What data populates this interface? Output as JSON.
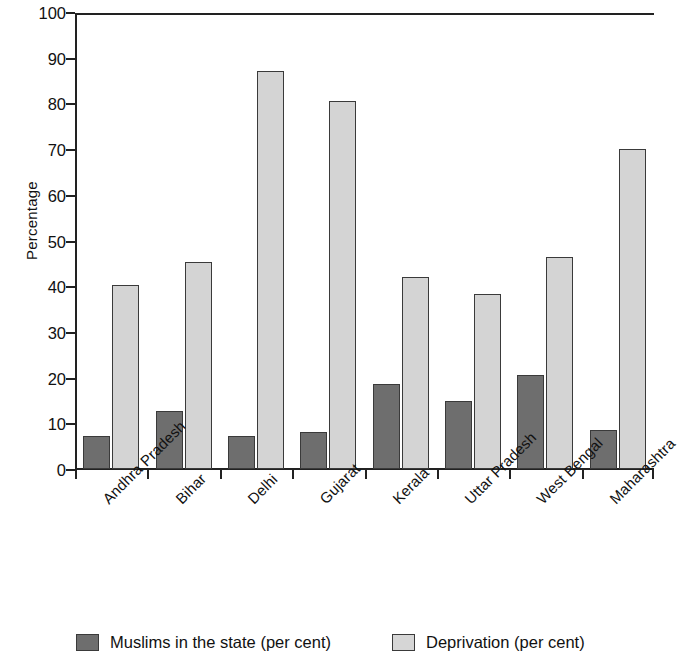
{
  "chart_data": {
    "type": "bar",
    "title": "",
    "xlabel": "",
    "ylabel": "Percentage",
    "ylim": [
      0,
      100
    ],
    "yticks": [
      0,
      10,
      20,
      30,
      40,
      50,
      60,
      70,
      80,
      90,
      100
    ],
    "grid": false,
    "legend_position": "bottom",
    "categories": [
      "Andhra Pradesh",
      "Bihar",
      "Delhi",
      "Gujarat",
      "Kerala",
      "Uttar Pradesh",
      "West Bengal",
      "Maharashtra"
    ],
    "series": [
      {
        "name": "Muslims in the state (per cent)",
        "color": "#6e6e6e",
        "values": [
          7.2,
          12.6,
          7.2,
          8.2,
          18.6,
          14.9,
          20.6,
          8.5
        ]
      },
      {
        "name": "Deprivation (per cent)",
        "color": "#d4d4d4",
        "values": [
          40.2,
          45.4,
          87.2,
          80.6,
          42.0,
          38.4,
          46.3,
          70.1
        ]
      }
    ]
  },
  "legend": {
    "items": [
      {
        "label": "Muslims in the state (per cent)",
        "swatch": "dark-swatch"
      },
      {
        "label": "Deprivation (per cent)",
        "swatch": "light-swatch"
      }
    ]
  },
  "axes": {
    "y_title": "Percentage",
    "y_tick_labels": [
      "100",
      "90",
      "80",
      "70",
      "60",
      "50",
      "40",
      "30",
      "20",
      "10",
      "0"
    ]
  }
}
